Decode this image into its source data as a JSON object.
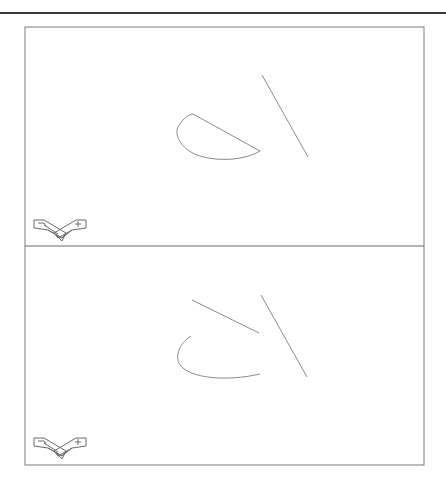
{
  "figure": {
    "type": "cad-two-viewport-drawing",
    "colors": {
      "background": "#ffffff",
      "frame": "#7a7a7a",
      "geometry": "#8a8a8a",
      "top_rule": "#3a3a3a"
    },
    "viewports": [
      {
        "name": "top-viewport",
        "objects": [
          {
            "kind": "line",
            "desc": "long diagonal line"
          },
          {
            "kind": "closed-arc-segment",
            "desc": "half-ellipse with chord"
          }
        ],
        "ucs_icon": "isometric-ucs-icon"
      },
      {
        "name": "bottom-viewport",
        "objects": [
          {
            "kind": "line",
            "desc": "long diagonal line"
          },
          {
            "kind": "line",
            "desc": "short diagonal line"
          },
          {
            "kind": "open-arc",
            "desc": "arc without chord"
          }
        ],
        "ucs_icon": "isometric-ucs-icon"
      }
    ]
  }
}
